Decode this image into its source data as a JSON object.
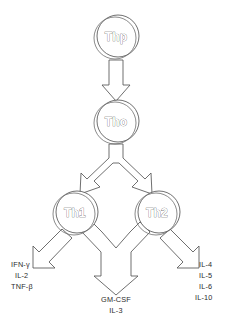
{
  "diagram": {
    "background_color": "#ffffff",
    "outline_color": "#555555",
    "text_color": "#2b2b2b",
    "nodes": [
      {
        "id": "thp",
        "label": "Thp",
        "cx": 116,
        "cy": 37,
        "r": 21
      },
      {
        "id": "tho",
        "label": "Tho",
        "cx": 116,
        "cy": 122,
        "r": 21
      },
      {
        "id": "th1",
        "label": "Th1",
        "cx": 75,
        "cy": 213,
        "r": 21
      },
      {
        "id": "th2",
        "label": "Th2",
        "cx": 157,
        "cy": 213,
        "r": 21
      }
    ],
    "outputs": {
      "th1_cytokines": {
        "name": "Th1 cytokines",
        "items": [
          "IFN-γ",
          "IL-2",
          "TNF-β"
        ]
      },
      "shared_cytokines": {
        "name": "Shared Th1/Th2 cytokines",
        "items": [
          "GM-CSF",
          "IL-3"
        ]
      },
      "th2_cytokines": {
        "name": "Th2 cytokines",
        "items": [
          "IL-4",
          "IL-5",
          "IL-6",
          "IL-10"
        ]
      }
    },
    "arrows": [
      {
        "id": "thp-to-tho",
        "type": "block-arrow-down",
        "from": "thp",
        "to": "tho"
      },
      {
        "id": "tho-to-th1th2",
        "type": "block-arrow-fork",
        "from": "tho",
        "to": [
          "th1",
          "th2"
        ]
      },
      {
        "id": "th1-to-left",
        "type": "block-arrow-diag-dl",
        "from": "th1",
        "to": "th1_cytokines"
      },
      {
        "id": "th1th2-to-mid",
        "type": "block-arrow-merge",
        "from": [
          "th1",
          "th2"
        ],
        "to": "shared_cytokines"
      },
      {
        "id": "th2-to-right",
        "type": "block-arrow-diag-dr",
        "from": "th2",
        "to": "th2_cytokines"
      }
    ]
  }
}
